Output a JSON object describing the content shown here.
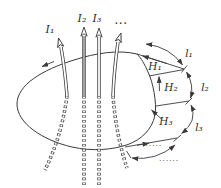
{
  "figure": {
    "type": "physics-diagram",
    "colors": {
      "stroke": "#3a3a3a",
      "background": "#ffffff",
      "wire_fill": "#ffffff",
      "wire2_fill": "#b0b0b0",
      "label": "#2b2b2b"
    },
    "labels": {
      "current_1": "I₁",
      "current_2": "I₂",
      "current_3": "I₃",
      "more_currents": "···",
      "field_1": "H₁",
      "field_2": "H₂",
      "field_3": "H₃",
      "segment_1": "l₁",
      "segment_2": "l₂",
      "segment_3": "l₃",
      "more_segments_chord": "······",
      "more_segments_arc": "······"
    }
  }
}
